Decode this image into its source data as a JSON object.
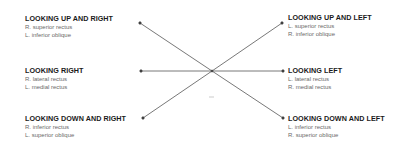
{
  "diagram": {
    "type": "eye-movement-directions",
    "center": [
      212,
      71
    ],
    "directions": [
      {
        "key": "up_right",
        "title": "LOOKING UP AND RIGHT",
        "muscles": [
          "R. superior rectus",
          "L. inferior oblique"
        ]
      },
      {
        "key": "up_left",
        "title": "LOOKING UP AND LEFT",
        "muscles": [
          "L. superior rectus",
          "R. inferior oblique"
        ]
      },
      {
        "key": "right",
        "title": "LOOKING RIGHT",
        "muscles": [
          "R. lateral rectus",
          "L. medial rectus"
        ]
      },
      {
        "key": "left",
        "title": "LOOKING LEFT",
        "muscles": [
          "L. lateral rectus",
          "R. medial rectus"
        ]
      },
      {
        "key": "down_right",
        "title": "LOOKING DOWN AND RIGHT",
        "muscles": [
          "R. inferior rectus",
          "L. superior oblique"
        ]
      },
      {
        "key": "down_left",
        "title": "LOOKING DOWN AND LEFT",
        "muscles": [
          "L. inferior rectus",
          "R. superior oblique"
        ]
      }
    ]
  },
  "colors": {
    "line": "#555555",
    "title": "#1a1a1a",
    "muscle": "#6a6a6a"
  }
}
